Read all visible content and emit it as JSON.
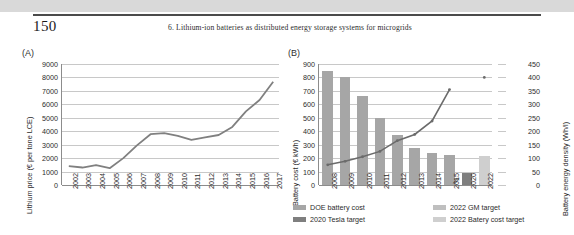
{
  "page": {
    "folio": "150",
    "running_head": "6. Lithium-ion batteries as distributed energy storage systems for microgrids"
  },
  "panel_a": {
    "letter": "(A)"
  },
  "panel_b": {
    "letter": "(B)"
  },
  "chart_data": [
    {
      "id": "panel-a",
      "type": "line",
      "title": "(A)",
      "xlabel": "",
      "ylabel": "Lithium price (€ per tone LCE)",
      "ylim": [
        0,
        9000
      ],
      "yticks": [
        0,
        1000,
        2000,
        3000,
        4000,
        5000,
        6000,
        7000,
        8000,
        9000
      ],
      "grid": true,
      "legend": "none",
      "categories": [
        "2002",
        "2003",
        "2004",
        "2005",
        "2006",
        "2007",
        "2008",
        "2009",
        "2010",
        "2011",
        "2012",
        "2013",
        "2014",
        "2015",
        "2016",
        "2017"
      ],
      "series": [
        {
          "name": "Lithium price",
          "color": "#808080",
          "values": [
            1400,
            1300,
            1480,
            1250,
            2000,
            2950,
            3780,
            3860,
            3650,
            3360,
            3550,
            3720,
            4320,
            5480,
            6320,
            7680
          ]
        }
      ]
    },
    {
      "id": "panel-b",
      "type": "bar",
      "title": "(B)",
      "xlabel": "",
      "ylabel": "Battery cost (€ kWh)",
      "y2label": "Battery energy density (Wh/l)",
      "ylim": [
        0,
        900
      ],
      "yticks": [
        0,
        100,
        200,
        300,
        400,
        500,
        600,
        700,
        800,
        900
      ],
      "y2lim": [
        0,
        450
      ],
      "y2ticks": [
        0,
        50,
        100,
        150,
        200,
        250,
        300,
        350,
        400,
        450
      ],
      "grid": true,
      "legend_position": "bottom",
      "categories": [
        "2008",
        "2009",
        "2010",
        "2011",
        "2012",
        "2013",
        "2014",
        "2015",
        "2020",
        "2022"
      ],
      "series": [
        {
          "name": "DOE battery cost",
          "kind": "bar",
          "axis": "left",
          "color": "#a6a6a6",
          "values": [
            850,
            800,
            660,
            495,
            375,
            275,
            240,
            222,
            null,
            null
          ]
        },
        {
          "name": "2020 Tesla target",
          "kind": "bar",
          "axis": "left",
          "color": "#7f7f7f",
          "values": [
            null,
            null,
            null,
            null,
            null,
            null,
            null,
            null,
            90,
            95
          ]
        },
        {
          "name": "2022 GM target",
          "kind": "bar",
          "axis": "left",
          "color": "#bfbfbf",
          "values": [
            null,
            null,
            null,
            null,
            null,
            null,
            null,
            null,
            null,
            0
          ]
        },
        {
          "name": "2022 Batery cost target",
          "kind": "bar",
          "axis": "left",
          "color": "#cfcfcf",
          "values": [
            null,
            null,
            null,
            null,
            null,
            null,
            null,
            null,
            null,
            218
          ]
        },
        {
          "name": "Battery energy density",
          "kind": "line",
          "axis": "right",
          "color": "#6b6b6b",
          "values": [
            75,
            88,
            105,
            125,
            165,
            188,
            238,
            355,
            null,
            400
          ]
        }
      ],
      "legend_items": [
        {
          "label": "DOE battery cost",
          "color": "#a6a6a6"
        },
        {
          "label": "2020 Tesla target",
          "color": "#7f7f7f"
        },
        {
          "label": "2022 GM target",
          "color": "#bfbfbf"
        },
        {
          "label": "2022 Batery cost target",
          "color": "#cfcfcf"
        }
      ],
      "axis_break": "//"
    }
  ]
}
